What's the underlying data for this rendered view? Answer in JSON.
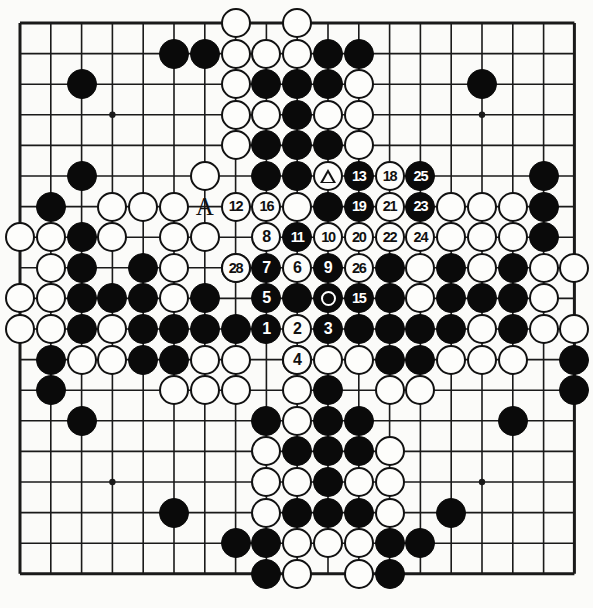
{
  "diagram": {
    "kind": "go-board-diagram",
    "board_size": 19,
    "grid": {
      "origin_x": 20,
      "origin_y": 23,
      "step_x": 30.8,
      "step_y": 30.6,
      "line_color": "#1a1a1a",
      "background_color": "#fbfbf9",
      "star_points": [
        [
          3,
          3
        ],
        [
          9,
          3
        ],
        [
          15,
          3
        ],
        [
          3,
          9
        ],
        [
          9,
          9
        ],
        [
          15,
          9
        ],
        [
          3,
          15
        ],
        [
          9,
          15
        ],
        [
          15,
          15
        ]
      ]
    },
    "colors": {
      "black_stone": "#0a0a0a",
      "white_stone": "#fdfdfb",
      "stone_outline": "#111111",
      "black_label_text": "#ffffff",
      "white_label_text": "#111111"
    },
    "text_labels": [
      {
        "text": "A",
        "col": 6,
        "row": 6,
        "name": "point-label-A"
      }
    ],
    "markers": [
      {
        "type": "triangle",
        "col": 10,
        "row": 5,
        "on": "white"
      },
      {
        "type": "circle",
        "col": 10,
        "row": 9,
        "on": "black"
      }
    ],
    "move_numbers": [
      {
        "n": "1",
        "col": 8,
        "row": 10,
        "color": "black"
      },
      {
        "n": "2",
        "col": 9,
        "row": 10,
        "color": "white"
      },
      {
        "n": "3",
        "col": 10,
        "row": 10,
        "color": "black"
      },
      {
        "n": "4",
        "col": 9,
        "row": 11,
        "color": "white"
      },
      {
        "n": "5",
        "col": 8,
        "row": 9,
        "color": "black"
      },
      {
        "n": "6",
        "col": 9,
        "row": 8,
        "color": "white"
      },
      {
        "n": "7",
        "col": 8,
        "row": 8,
        "color": "black"
      },
      {
        "n": "8",
        "col": 8,
        "row": 7,
        "color": "white"
      },
      {
        "n": "9",
        "col": 10,
        "row": 8,
        "color": "black"
      },
      {
        "n": "10",
        "col": 10,
        "row": 7,
        "color": "white"
      },
      {
        "n": "11",
        "col": 9,
        "row": 7,
        "color": "black"
      },
      {
        "n": "12",
        "col": 7,
        "row": 6,
        "color": "white"
      },
      {
        "n": "13",
        "col": 11,
        "row": 5,
        "color": "black"
      },
      {
        "n": "15",
        "col": 11,
        "row": 9,
        "color": "black"
      },
      {
        "n": "16",
        "col": 8,
        "row": 6,
        "color": "white"
      },
      {
        "n": "18",
        "col": 12,
        "row": 5,
        "color": "white"
      },
      {
        "n": "19",
        "col": 11,
        "row": 6,
        "color": "black"
      },
      {
        "n": "20",
        "col": 11,
        "row": 7,
        "color": "white"
      },
      {
        "n": "21",
        "col": 12,
        "row": 6,
        "color": "white"
      },
      {
        "n": "22",
        "col": 12,
        "row": 7,
        "color": "white"
      },
      {
        "n": "23",
        "col": 13,
        "row": 6,
        "color": "black"
      },
      {
        "n": "24",
        "col": 13,
        "row": 7,
        "color": "white"
      },
      {
        "n": "25",
        "col": 13,
        "row": 5,
        "color": "black"
      },
      {
        "n": "26",
        "col": 11,
        "row": 8,
        "color": "white"
      },
      {
        "n": "28",
        "col": 7,
        "row": 8,
        "color": "white"
      }
    ],
    "black_stones": [
      [
        5,
        1
      ],
      [
        6,
        1
      ],
      [
        10,
        1
      ],
      [
        11,
        1
      ],
      [
        2,
        2
      ],
      [
        8,
        2
      ],
      [
        9,
        2
      ],
      [
        10,
        2
      ],
      [
        15,
        2
      ],
      [
        9,
        3
      ],
      [
        8,
        4
      ],
      [
        9,
        4
      ],
      [
        10,
        4
      ],
      [
        2,
        5
      ],
      [
        8,
        5
      ],
      [
        9,
        5
      ],
      [
        17,
        5
      ],
      [
        1,
        6
      ],
      [
        10,
        6
      ],
      [
        17,
        6
      ],
      [
        2,
        7
      ],
      [
        17,
        7
      ],
      [
        2,
        8
      ],
      [
        4,
        8
      ],
      [
        12,
        8
      ],
      [
        14,
        8
      ],
      [
        16,
        8
      ],
      [
        2,
        9
      ],
      [
        3,
        9
      ],
      [
        4,
        9
      ],
      [
        6,
        9
      ],
      [
        9,
        9
      ],
      [
        12,
        9
      ],
      [
        14,
        9
      ],
      [
        15,
        9
      ],
      [
        16,
        9
      ],
      [
        2,
        10
      ],
      [
        4,
        10
      ],
      [
        5,
        10
      ],
      [
        6,
        10
      ],
      [
        7,
        10
      ],
      [
        11,
        10
      ],
      [
        12,
        10
      ],
      [
        13,
        10
      ],
      [
        14,
        10
      ],
      [
        16,
        10
      ],
      [
        1,
        11
      ],
      [
        4,
        11
      ],
      [
        5,
        11
      ],
      [
        12,
        11
      ],
      [
        13,
        11
      ],
      [
        18,
        11
      ],
      [
        1,
        12
      ],
      [
        10,
        12
      ],
      [
        18,
        12
      ],
      [
        2,
        13
      ],
      [
        8,
        13
      ],
      [
        10,
        13
      ],
      [
        11,
        13
      ],
      [
        16,
        13
      ],
      [
        9,
        14
      ],
      [
        10,
        14
      ],
      [
        11,
        14
      ],
      [
        10,
        15
      ],
      [
        5,
        16
      ],
      [
        9,
        16
      ],
      [
        10,
        16
      ],
      [
        11,
        16
      ],
      [
        14,
        16
      ],
      [
        7,
        17
      ],
      [
        8,
        17
      ],
      [
        12,
        17
      ],
      [
        13,
        17
      ],
      [
        8,
        18
      ],
      [
        12,
        18
      ]
    ],
    "white_stones": [
      [
        7,
        0
      ],
      [
        9,
        0
      ],
      [
        7,
        1
      ],
      [
        8,
        1
      ],
      [
        9,
        1
      ],
      [
        7,
        2
      ],
      [
        11,
        2
      ],
      [
        7,
        3
      ],
      [
        8,
        3
      ],
      [
        10,
        3
      ],
      [
        11,
        3
      ],
      [
        7,
        4
      ],
      [
        11,
        4
      ],
      [
        6,
        5
      ],
      [
        3,
        6
      ],
      [
        4,
        6
      ],
      [
        5,
        6
      ],
      [
        9,
        6
      ],
      [
        14,
        6
      ],
      [
        15,
        6
      ],
      [
        16,
        6
      ],
      [
        0,
        7
      ],
      [
        1,
        7
      ],
      [
        3,
        7
      ],
      [
        5,
        7
      ],
      [
        6,
        7
      ],
      [
        14,
        7
      ],
      [
        15,
        7
      ],
      [
        16,
        7
      ],
      [
        1,
        8
      ],
      [
        5,
        8
      ],
      [
        7,
        8
      ],
      [
        13,
        8
      ],
      [
        15,
        8
      ],
      [
        17,
        8
      ],
      [
        18,
        8
      ],
      [
        0,
        9
      ],
      [
        1,
        9
      ],
      [
        5,
        9
      ],
      [
        13,
        9
      ],
      [
        17,
        9
      ],
      [
        0,
        10
      ],
      [
        1,
        10
      ],
      [
        3,
        10
      ],
      [
        15,
        10
      ],
      [
        17,
        10
      ],
      [
        18,
        10
      ],
      [
        2,
        11
      ],
      [
        3,
        11
      ],
      [
        6,
        11
      ],
      [
        7,
        11
      ],
      [
        9,
        11
      ],
      [
        10,
        11
      ],
      [
        11,
        11
      ],
      [
        14,
        11
      ],
      [
        15,
        11
      ],
      [
        16,
        11
      ],
      [
        5,
        12
      ],
      [
        6,
        12
      ],
      [
        7,
        12
      ],
      [
        9,
        12
      ],
      [
        12,
        12
      ],
      [
        13,
        12
      ],
      [
        9,
        13
      ],
      [
        8,
        14
      ],
      [
        12,
        14
      ],
      [
        8,
        15
      ],
      [
        9,
        15
      ],
      [
        11,
        15
      ],
      [
        12,
        15
      ],
      [
        8,
        16
      ],
      [
        12,
        16
      ],
      [
        9,
        17
      ],
      [
        10,
        17
      ],
      [
        11,
        17
      ],
      [
        9,
        18
      ],
      [
        11,
        18
      ]
    ]
  }
}
